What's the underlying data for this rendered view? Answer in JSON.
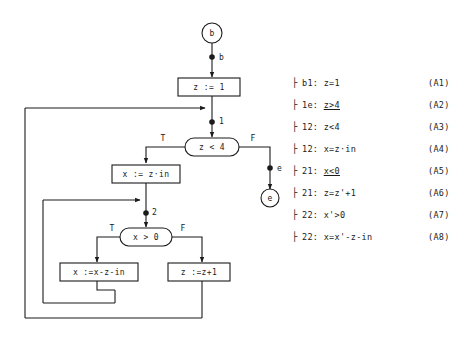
{
  "diagram": {
    "start_node": {
      "name": "start-node",
      "label": "b"
    },
    "end_node": {
      "name": "end-node",
      "label": "e"
    },
    "process_nodes": [
      {
        "id": "p1",
        "label": "z := 1"
      },
      {
        "id": "p2",
        "label": "x := z·in"
      },
      {
        "id": "p3",
        "label": "x :=x-z-in"
      },
      {
        "id": "p4",
        "label": "z :=z+1"
      }
    ],
    "decision_nodes": [
      {
        "id": "d1",
        "label": "z < 4",
        "true_label": "T",
        "false_label": "F"
      },
      {
        "id": "d2",
        "label": "x > 0",
        "true_label": "T",
        "false_label": "F"
      }
    ],
    "cut_points": [
      {
        "id": "cp-b",
        "label": "b"
      },
      {
        "id": "cp-1",
        "label": "1"
      },
      {
        "id": "cp-2",
        "label": "2"
      },
      {
        "id": "cp-e",
        "label": "e"
      }
    ]
  },
  "assertions": {
    "items": [
      {
        "bullet": "├",
        "path": "b1:",
        "formula": "z=1",
        "tag": "(A1)",
        "underline": ""
      },
      {
        "bullet": "├",
        "path": "1e:",
        "formula": "z>4",
        "tag": "(A2)",
        "underline": "geq"
      },
      {
        "bullet": "├",
        "path": "12:",
        "formula": "z<4",
        "tag": "(A3)",
        "underline": ""
      },
      {
        "bullet": "├",
        "path": "12:",
        "formula": "x=z·in",
        "tag": "(A4)",
        "underline": ""
      },
      {
        "bullet": "├",
        "path": "21:",
        "formula": "x<0",
        "tag": "(A5)",
        "underline": "leq"
      },
      {
        "bullet": "├",
        "path": "21:",
        "formula": "z=z'+1",
        "tag": "(A6)",
        "underline": ""
      },
      {
        "bullet": "├",
        "path": "22:",
        "formula": "x'>0",
        "tag": "(A7)",
        "underline": ""
      },
      {
        "bullet": "├",
        "path": "22:",
        "formula": "x=x'-z-in",
        "tag": "(A8)",
        "underline": ""
      }
    ]
  },
  "colors": {
    "ink": "#1b1b1b",
    "paper": "#ffffff"
  }
}
